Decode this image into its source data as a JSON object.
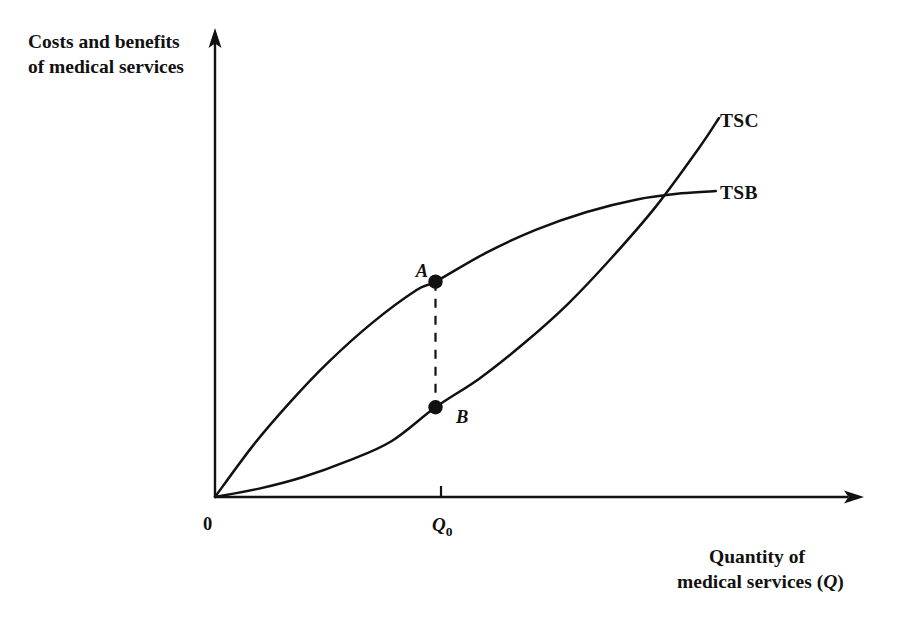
{
  "figure": {
    "background_color": "#ffffff",
    "ink_color": "#111111"
  },
  "labels": {
    "y_axis_line1": "Costs and benefits",
    "y_axis_line2": "of medical services",
    "x_axis_line1": "Quantity of",
    "x_axis_line2_prefix": "medical services (",
    "x_axis_line2_var": "Q",
    "x_axis_line2_suffix": ")",
    "origin": "0",
    "q0_var": "Q",
    "q0_sub": "0",
    "curve_tsc": "TSC",
    "curve_tsb": "TSB",
    "point_a": "A",
    "point_b": "B"
  },
  "chart_data": {
    "type": "line",
    "title": "",
    "xlabel": "Quantity of medical services (Q)",
    "ylabel": "Costs and benefits of medical services",
    "grid": false,
    "legend_position": "right-of-curve-ends",
    "axis_style": "arrow-headed origin axes, no numeric scale",
    "xlim": [
      0,
      1
    ],
    "ylim": [
      0,
      1
    ],
    "x_ticks": [
      {
        "label": "0",
        "x": 0.0
      },
      {
        "label": "Q0",
        "x": 0.35
      }
    ],
    "y_ticks": [],
    "series": [
      {
        "name": "TSC",
        "description": "Total social cost — convex, increasing at an increasing rate",
        "label_anchor": {
          "x": 0.775,
          "y": 0.815
        },
        "points": [
          {
            "x": 0.0,
            "y": 0.0
          },
          {
            "x": 0.07,
            "y": 0.018
          },
          {
            "x": 0.14,
            "y": 0.043
          },
          {
            "x": 0.21,
            "y": 0.077
          },
          {
            "x": 0.28,
            "y": 0.12
          },
          {
            "x": 0.35,
            "y": 0.193
          },
          {
            "x": 0.42,
            "y": 0.255
          },
          {
            "x": 0.49,
            "y": 0.33
          },
          {
            "x": 0.56,
            "y": 0.415
          },
          {
            "x": 0.63,
            "y": 0.515
          },
          {
            "x": 0.7,
            "y": 0.625
          },
          {
            "x": 0.768,
            "y": 0.75
          },
          {
            "x": 0.8,
            "y": 0.815
          }
        ]
      },
      {
        "name": "TSB",
        "description": "Total social benefit — concave, increasing at a decreasing rate",
        "label_anchor": {
          "x": 0.775,
          "y": 0.658
        },
        "points": [
          {
            "x": 0.0,
            "y": 0.0
          },
          {
            "x": 0.06,
            "y": 0.11
          },
          {
            "x": 0.12,
            "y": 0.205
          },
          {
            "x": 0.18,
            "y": 0.29
          },
          {
            "x": 0.25,
            "y": 0.375
          },
          {
            "x": 0.32,
            "y": 0.445
          },
          {
            "x": 0.35,
            "y": 0.463
          },
          {
            "x": 0.43,
            "y": 0.525
          },
          {
            "x": 0.51,
            "y": 0.575
          },
          {
            "x": 0.59,
            "y": 0.613
          },
          {
            "x": 0.67,
            "y": 0.64
          },
          {
            "x": 0.74,
            "y": 0.653
          },
          {
            "x": 0.795,
            "y": 0.658
          }
        ]
      }
    ],
    "annotations": [
      {
        "name": "A",
        "on_series": "TSB",
        "x": 0.35,
        "y": 0.463,
        "label_side": "left",
        "marker": "filled-circle"
      },
      {
        "name": "B",
        "on_series": "TSC",
        "x": 0.35,
        "y": 0.193,
        "label_side": "right",
        "marker": "filled-circle"
      }
    ],
    "connectors": [
      {
        "name": "A-B vertical",
        "style": "dashed",
        "from": {
          "x": 0.35,
          "y": 0.463
        },
        "to": {
          "x": 0.35,
          "y": 0.193
        }
      }
    ],
    "crossing_point": {
      "x": 0.7,
      "y": 0.648,
      "note": "TSC cuts TSB from below"
    }
  }
}
